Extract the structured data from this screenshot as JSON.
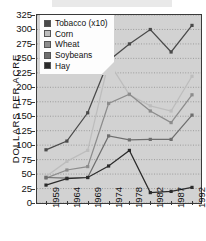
{
  "chart_data": {
    "type": "line",
    "title": "",
    "xlabel": "",
    "ylabel": "DOLLARS PER ACRE",
    "categories": [
      "1959",
      "1964",
      "1969",
      "1974",
      "1978",
      "1982",
      "1987",
      "1992"
    ],
    "ylim": [
      0,
      325
    ],
    "ytick_step": 25,
    "yticks": [
      "325",
      "300",
      "275",
      "250",
      "225",
      "200",
      "175",
      "150",
      "125",
      "100",
      "75",
      "50",
      "25",
      "0"
    ],
    "grid": true,
    "grid_orientation": "horizontal",
    "legend_position": "top-left",
    "series": [
      {
        "name": "Tobacco (x10)",
        "color": "#4a4a4a",
        "values": [
          92,
          107,
          156,
          246,
          275,
          300,
          261,
          307
        ]
      },
      {
        "name": "Corn",
        "color": "#bdbdbd",
        "values": [
          46,
          72,
          91,
          244,
          187,
          168,
          159,
          219
        ]
      },
      {
        "name": "Wheat",
        "color": "#8c8c8c",
        "values": [
          43,
          57,
          63,
          172,
          188,
          159,
          139,
          187
        ]
      },
      {
        "name": "Soybeans",
        "color": "#6e6e6e",
        "values": [
          44,
          43,
          44,
          116,
          109,
          110,
          110,
          152
        ]
      },
      {
        "name": "Hay",
        "color": "#2b2b2b",
        "values": [
          31,
          42,
          44,
          64,
          91,
          18,
          20,
          27
        ]
      }
    ]
  }
}
